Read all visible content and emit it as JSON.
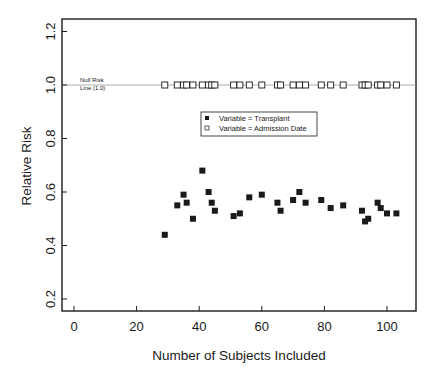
{
  "chart_data": {
    "type": "scatter",
    "title": "",
    "xlabel": "Number of Subjects Included",
    "ylabel": "Relative Risk",
    "xlim": [
      -4,
      109
    ],
    "ylim": [
      0.16,
      1.25
    ],
    "xticks": [
      0,
      20,
      40,
      60,
      80,
      100
    ],
    "yticks": [
      0.2,
      0.4,
      0.6,
      0.8,
      1.0,
      1.2
    ],
    "xtick_labels": [
      "0",
      "20",
      "40",
      "60",
      "80",
      "100"
    ],
    "ytick_labels": [
      "0.2",
      "0.4",
      "0.6",
      "0.8",
      "1.0",
      "1.2"
    ],
    "grid": false,
    "legend_position": "upper center, inside plot",
    "reference_line": {
      "y": 1.0,
      "label_line1": "Null Risk",
      "label_line2": "Line (1.0)"
    },
    "series": [
      {
        "name": "Variable = Transplant",
        "marker": "filled-square",
        "color": "#1a1a1a",
        "points": [
          [
            29,
            0.44
          ],
          [
            33,
            0.55
          ],
          [
            35,
            0.59
          ],
          [
            36,
            0.56
          ],
          [
            38,
            0.5
          ],
          [
            41,
            0.68
          ],
          [
            43,
            0.6
          ],
          [
            44,
            0.56
          ],
          [
            45,
            0.53
          ],
          [
            51,
            0.51
          ],
          [
            53,
            0.52
          ],
          [
            56,
            0.58
          ],
          [
            60,
            0.59
          ],
          [
            65,
            0.56
          ],
          [
            66,
            0.53
          ],
          [
            70,
            0.57
          ],
          [
            72,
            0.6
          ],
          [
            74,
            0.56
          ],
          [
            79,
            0.57
          ],
          [
            82,
            0.54
          ],
          [
            86,
            0.55
          ],
          [
            92,
            0.53
          ],
          [
            93,
            0.49
          ],
          [
            94,
            0.5
          ],
          [
            97,
            0.56
          ],
          [
            98,
            0.54
          ],
          [
            100,
            0.52
          ],
          [
            103,
            0.52
          ]
        ]
      },
      {
        "name": "Variable = Admission Date",
        "marker": "open-square",
        "color": "#1a1a1a",
        "points": [
          [
            29,
            1.0
          ],
          [
            33,
            1.0
          ],
          [
            35,
            1.0
          ],
          [
            36,
            1.0
          ],
          [
            38,
            1.0
          ],
          [
            41,
            1.0
          ],
          [
            43,
            1.0
          ],
          [
            44,
            1.0
          ],
          [
            45,
            1.0
          ],
          [
            51,
            1.0
          ],
          [
            53,
            1.0
          ],
          [
            56,
            1.0
          ],
          [
            60,
            1.0
          ],
          [
            65,
            1.0
          ],
          [
            66,
            1.0
          ],
          [
            70,
            1.0
          ],
          [
            72,
            1.0
          ],
          [
            74,
            1.0
          ],
          [
            79,
            1.0
          ],
          [
            82,
            1.0
          ],
          [
            86,
            1.0
          ],
          [
            92,
            1.0
          ],
          [
            93,
            1.0
          ],
          [
            94,
            1.0
          ],
          [
            97,
            1.0
          ],
          [
            98,
            1.0
          ],
          [
            100,
            1.0
          ],
          [
            103,
            1.0
          ]
        ]
      }
    ]
  },
  "colors": {
    "ink": "#1a1a1a",
    "reference_line": "#9a9a9a",
    "background": "#ffffff"
  }
}
